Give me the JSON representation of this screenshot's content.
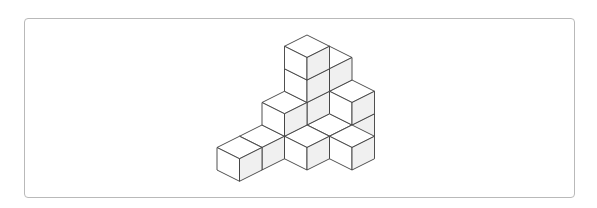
{
  "figure": {
    "cube_count": 14,
    "colors": {
      "top_face": "#ffffff",
      "left_face": "#ffffff",
      "right_face": "#f0f0f0",
      "edge": "#3c3c3c",
      "frame_border": "#b9b9b9",
      "background": "#ffffff"
    },
    "projection": {
      "origin_x": 307,
      "origin_y": 125,
      "half_width": 22.5,
      "half_height": 11.25
    },
    "cubes": [
      {
        "x": 0,
        "y": -1,
        "z": 0
      },
      {
        "x": 0,
        "y": -1,
        "z": 1
      },
      {
        "x": 0,
        "y": -1,
        "z": 2
      },
      {
        "x": 0,
        "y": 0,
        "z": 0
      },
      {
        "x": 0,
        "y": 0,
        "z": 1
      },
      {
        "x": 0,
        "y": 0,
        "z": 2
      },
      {
        "x": 0,
        "y": 0,
        "z": 3
      },
      {
        "x": 1,
        "y": -1,
        "z": 0
      },
      {
        "x": 1,
        "y": -1,
        "z": 1
      },
      {
        "x": 1,
        "y": 0,
        "z": 0
      },
      {
        "x": 0,
        "y": 1,
        "z": 0
      },
      {
        "x": 0,
        "y": 1,
        "z": 1
      },
      {
        "x": 0,
        "y": 2,
        "z": 0
      },
      {
        "x": 0,
        "y": 3,
        "z": 0
      },
      {
        "x": 1,
        "y": 1,
        "z": 0
      },
      {
        "x": 2,
        "y": 0,
        "z": 0
      }
    ]
  }
}
